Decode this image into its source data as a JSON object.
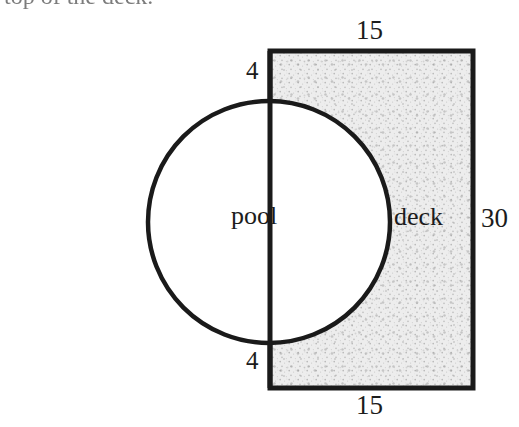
{
  "figure": {
    "caption_partial": "top of the deck.",
    "stroke_color": "#1a1a1a",
    "deck_fill_color": "#e9e9e9",
    "pool_fill_color": "#ffffff"
  },
  "labels": {
    "top_width": "15",
    "bottom_width": "15",
    "right_height": "30",
    "top_gap": "4",
    "bottom_gap": "4",
    "pool_region": "pool",
    "deck_region": "deck"
  },
  "geometry": {
    "deck_rect": {
      "x": 270,
      "y": 51,
      "width": 203,
      "height": 337
    },
    "pool_circle": {
      "cx": 269,
      "cy": 222,
      "r": 121
    }
  }
}
